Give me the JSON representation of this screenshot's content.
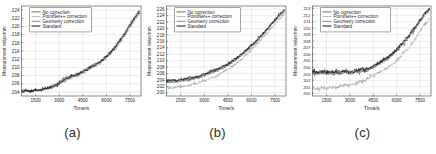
{
  "figure": {
    "panels": [
      {
        "caption": "(a)",
        "chart_data": {
          "type": "line",
          "title": "",
          "xlabel": "Time/s",
          "ylabel": "Measurement value/mm",
          "xlim": [
            600,
            8200
          ],
          "ylim": [
            203,
            225
          ],
          "xticks": [
            1500,
            3000,
            4500,
            6000,
            7500
          ],
          "yticks": [
            204,
            206,
            208,
            210,
            212,
            214,
            216,
            218,
            220,
            222,
            224
          ],
          "grid": true,
          "legend_position": "upper-left",
          "legend": [
            "No correction",
            "PointNet++ correction",
            "Geometry correction",
            "Standard"
          ],
          "x": [
            600,
            900,
            1200,
            1500,
            1800,
            2100,
            2400,
            2700,
            3000,
            3300,
            3600,
            3900,
            4200,
            4500,
            4800,
            5100,
            5400,
            5700,
            6000,
            6300,
            6600,
            6900,
            7200,
            7500,
            7800,
            8100
          ],
          "series": [
            {
              "name": "No correction",
              "color": "#2e2e2e",
              "values": [
                204.1,
                204.3,
                204.2,
                204.5,
                204.4,
                204.8,
                205.1,
                205.6,
                206.2,
                207.1,
                207.6,
                207.9,
                208.4,
                208.9,
                209.6,
                210.4,
                210.9,
                211.6,
                212.6,
                213.9,
                215.2,
                216.8,
                218.4,
                220.3,
                222.1,
                223.6
              ]
            },
            {
              "name": "PointNet++ correction",
              "color": "#9a9a9a",
              "values": [
                204.0,
                204.2,
                204.1,
                204.3,
                204.3,
                204.6,
                204.9,
                205.3,
                205.8,
                206.6,
                207.2,
                207.5,
                208.0,
                208.5,
                209.2,
                210.0,
                210.5,
                211.2,
                212.2,
                213.4,
                214.7,
                216.2,
                217.9,
                219.7,
                221.5,
                223.0
              ]
            },
            {
              "name": "Geometry correction",
              "color": "#565656",
              "values": [
                204.2,
                204.4,
                204.3,
                204.6,
                204.5,
                204.9,
                205.2,
                205.8,
                206.5,
                207.4,
                207.8,
                208.1,
                208.6,
                209.1,
                209.8,
                210.6,
                211.1,
                211.8,
                212.8,
                214.1,
                215.5,
                217.1,
                218.7,
                220.6,
                222.4,
                223.9
              ]
            },
            {
              "name": "Standard",
              "color": "#111111",
              "values": [
                204.1,
                204.3,
                204.2,
                204.4,
                204.4,
                204.7,
                205.0,
                205.5,
                206.1,
                207.0,
                207.5,
                207.8,
                208.3,
                208.8,
                209.5,
                210.3,
                210.8,
                211.5,
                212.5,
                213.8,
                215.1,
                216.7,
                218.3,
                220.2,
                222.0,
                223.5
              ]
            }
          ]
        }
      },
      {
        "caption": "(b)",
        "chart_data": {
          "type": "line",
          "title": "",
          "xlabel": "Time/s",
          "ylabel": "Measurement value/mm",
          "xlim": [
            600,
            8200
          ],
          "ylim": [
            199,
            227
          ],
          "xticks": [
            1500,
            3000,
            4500,
            6000,
            7500
          ],
          "yticks": [
            200,
            202,
            204,
            206,
            208,
            210,
            212,
            214,
            216,
            218,
            220,
            222,
            224,
            226
          ],
          "grid": true,
          "legend_position": "upper-left",
          "legend": [
            "No correction",
            "PointNet++ correction",
            "Geometry correction",
            "Standard"
          ],
          "x": [
            600,
            900,
            1200,
            1500,
            1800,
            2100,
            2400,
            2700,
            3000,
            3300,
            3600,
            3900,
            4200,
            4500,
            4800,
            5100,
            5400,
            5700,
            6000,
            6300,
            6600,
            6900,
            7200,
            7500,
            7800,
            8100
          ],
          "series": [
            {
              "name": "No correction",
              "color": "#2e2e2e",
              "values": [
                203.6,
                203.8,
                203.7,
                204.0,
                204.2,
                204.4,
                204.7,
                205.1,
                205.6,
                206.2,
                206.8,
                207.3,
                208.0,
                208.8,
                209.8,
                210.8,
                212.0,
                213.3,
                214.6,
                216.0,
                217.6,
                219.2,
                220.9,
                222.6,
                224.2,
                225.6
              ]
            },
            {
              "name": "PointNet++ correction",
              "color": "#9a9a9a",
              "values": [
                201.6,
                201.4,
                201.8,
                202.1,
                202.0,
                202.4,
                202.8,
                203.2,
                203.7,
                204.3,
                205.0,
                205.6,
                206.4,
                207.3,
                208.3,
                209.4,
                210.6,
                211.9,
                213.3,
                214.8,
                216.4,
                218.1,
                219.8,
                221.5,
                223.1,
                224.4
              ]
            },
            {
              "name": "Geometry correction",
              "color": "#565656",
              "values": [
                203.2,
                203.4,
                203.3,
                203.6,
                203.8,
                204.0,
                204.4,
                204.8,
                205.3,
                205.9,
                206.5,
                207.0,
                207.7,
                208.5,
                209.5,
                210.5,
                211.7,
                213.0,
                214.3,
                215.7,
                217.3,
                218.9,
                220.6,
                222.3,
                223.9,
                225.2
              ]
            },
            {
              "name": "Standard",
              "color": "#111111",
              "values": [
                203.8,
                204.0,
                203.9,
                204.2,
                204.3,
                204.6,
                204.9,
                205.3,
                205.8,
                206.4,
                207.0,
                207.5,
                208.2,
                209.0,
                210.0,
                211.0,
                212.2,
                213.5,
                214.8,
                216.2,
                217.8,
                219.4,
                221.1,
                222.8,
                224.4,
                225.8
              ]
            }
          ]
        }
      },
      {
        "caption": "(c)",
        "chart_data": {
          "type": "line",
          "title": "",
          "xlabel": "Time/s",
          "ylabel": "Measurement value/mm",
          "xlim": [
            600,
            8200
          ],
          "ylim": [
            199.6,
            213.4
          ],
          "xticks": [
            1500,
            3000,
            4500,
            6000,
            7500
          ],
          "yticks": [
            200,
            201,
            202,
            203,
            204,
            205,
            206,
            207,
            208,
            209,
            210,
            211,
            212,
            213
          ],
          "grid": true,
          "legend_position": "upper-left",
          "legend": [
            "No correction",
            "PointNet++ correction",
            "Geometry correction",
            "Standard"
          ],
          "x": [
            600,
            900,
            1200,
            1500,
            1800,
            2100,
            2400,
            2700,
            3000,
            3300,
            3600,
            3900,
            4200,
            4500,
            4800,
            5100,
            5400,
            5700,
            6000,
            6300,
            6600,
            6900,
            7200,
            7500,
            7800,
            8100
          ],
          "series": [
            {
              "name": "No correction",
              "color": "#2e2e2e",
              "values": [
                203.3,
                203.2,
                203.3,
                203.2,
                203.3,
                203.2,
                203.3,
                203.4,
                203.3,
                203.4,
                203.5,
                203.6,
                203.8,
                204.2,
                204.6,
                205.0,
                205.4,
                206.0,
                206.7,
                207.5,
                208.3,
                209.2,
                210.1,
                211.2,
                212.2,
                212.9
              ]
            },
            {
              "name": "PointNet++ correction",
              "color": "#9a9a9a",
              "values": [
                200.8,
                200.6,
                200.9,
                200.7,
                201.0,
                200.8,
                201.1,
                201.4,
                201.2,
                201.5,
                201.8,
                202.0,
                202.3,
                202.7,
                203.1,
                203.5,
                203.9,
                204.4,
                205.0,
                205.8,
                206.6,
                207.5,
                208.5,
                209.6,
                210.6,
                211.3
              ]
            },
            {
              "name": "Geometry correction",
              "color": "#565656",
              "values": [
                203.1,
                203.0,
                203.1,
                203.0,
                203.1,
                203.0,
                203.1,
                203.2,
                203.1,
                203.2,
                203.3,
                203.4,
                203.6,
                204.0,
                204.4,
                204.8,
                205.2,
                205.8,
                206.5,
                207.3,
                208.1,
                209.0,
                209.9,
                211.0,
                212.0,
                212.7
              ]
            },
            {
              "name": "Standard",
              "color": "#111111",
              "values": [
                203.4,
                203.3,
                203.4,
                203.3,
                203.4,
                203.3,
                203.4,
                203.5,
                203.4,
                203.5,
                203.6,
                203.7,
                203.9,
                204.3,
                204.7,
                205.1,
                205.5,
                206.1,
                206.8,
                207.6,
                208.4,
                209.3,
                210.2,
                211.3,
                212.3,
                213.0
              ]
            }
          ]
        }
      }
    ]
  }
}
